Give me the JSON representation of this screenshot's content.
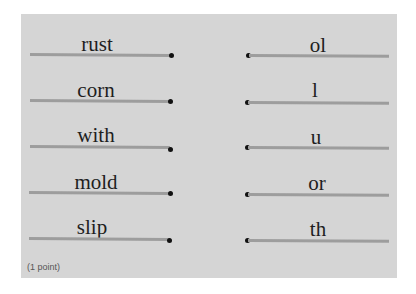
{
  "exercise": {
    "left_items": [
      {
        "label": "rust"
      },
      {
        "label": "corn"
      },
      {
        "label": "with"
      },
      {
        "label": "mold"
      },
      {
        "label": "slip"
      }
    ],
    "right_items": [
      {
        "label": "ol"
      },
      {
        "label": "l"
      },
      {
        "label": "u"
      },
      {
        "label": "or"
      },
      {
        "label": "th"
      }
    ],
    "points_label": "(1 point)"
  },
  "colors": {
    "panel_background": "#d5d5d5",
    "line": "#9d9d9d",
    "dot": "#111111",
    "text": "#1e1e1e"
  }
}
